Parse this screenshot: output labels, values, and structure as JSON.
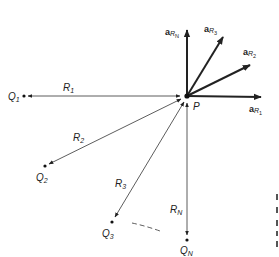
{
  "diagram": {
    "type": "vector-field-superposition",
    "center_point": {
      "label": "P",
      "x": 187,
      "y": 96
    },
    "charges": [
      {
        "label": "Q",
        "sub": "1",
        "x": 24,
        "y": 96,
        "distance_label": "R",
        "distance_sub": "1",
        "dl_x": 63,
        "dl_y": 89
      },
      {
        "label": "Q",
        "sub": "2",
        "x": 45,
        "y": 166,
        "distance_label": "R",
        "distance_sub": "2",
        "dl_x": 74,
        "dl_y": 140
      },
      {
        "label": "Q",
        "sub": "3",
        "x": 112,
        "y": 222,
        "distance_label": "R",
        "distance_sub": "3",
        "dl_x": 116,
        "dl_y": 186
      },
      {
        "label": "Q",
        "sub": "N",
        "x": 187,
        "y": 240,
        "distance_label": "R",
        "distance_sub": "N",
        "dl_x": 171,
        "dl_y": 212
      }
    ],
    "unit_vectors": [
      {
        "label": "a",
        "sub": "R1",
        "tip_x": 263,
        "tip_y": 97,
        "lx": 249,
        "ly": 111
      },
      {
        "label": "a",
        "sub": "R2",
        "tip_x": 252,
        "tip_y": 64,
        "lx": 243,
        "ly": 55
      },
      {
        "label": "a",
        "sub": "R3",
        "tip_x": 224,
        "tip_y": 35,
        "lx": 205,
        "ly": 32
      },
      {
        "label": "a",
        "sub": "RN",
        "tip_x": 187,
        "tip_y": 28,
        "lx": 164,
        "ly": 35
      }
    ],
    "labels": {
      "P": "P",
      "Q1": "Q",
      "Q1_sub": "1",
      "Q2": "Q",
      "Q2_sub": "2",
      "Q3": "Q",
      "Q3_sub": "3",
      "QN": "Q",
      "QN_sub": "N",
      "R1": "R",
      "R1_sub": "1",
      "R2": "R",
      "R2_sub": "2",
      "R3": "R",
      "R3_sub": "3",
      "RN": "R",
      "RN_sub": "N",
      "aR1": "a",
      "aR1_sub": "R",
      "aR1_subsub": "1",
      "aR2": "a",
      "aR2_sub": "R",
      "aR2_subsub": "2",
      "aR3": "a",
      "aR3_sub": "R",
      "aR3_subsub": "3",
      "aRN": "a",
      "aRN_sub": "R",
      "aRN_subsub": "N"
    },
    "colors": {
      "ink": "#222222",
      "background": "#ffffff"
    }
  }
}
